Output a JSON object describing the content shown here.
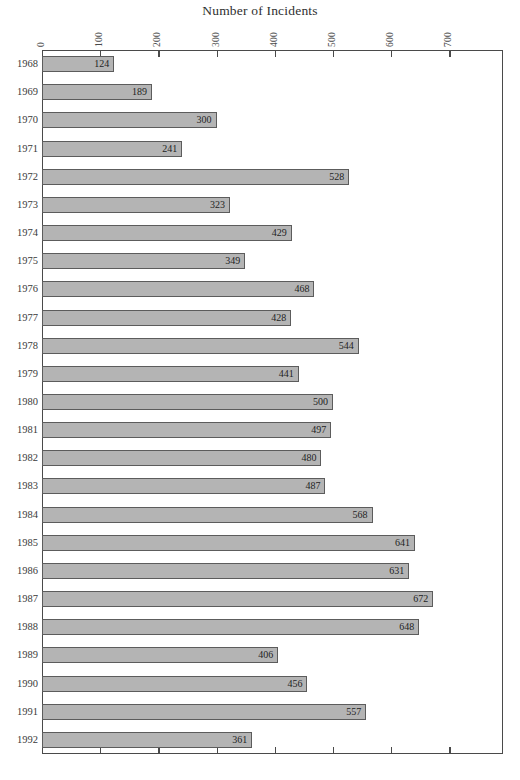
{
  "chart_data": {
    "type": "bar",
    "orientation": "horizontal",
    "title": "Number of Incidents",
    "xlabel": "",
    "ylabel": "",
    "xlim": [
      0,
      792
    ],
    "xticks": [
      0,
      100,
      200,
      300,
      400,
      500,
      600,
      700
    ],
    "xtick_labels": [
      "0",
      "100",
      "200",
      "300",
      "400",
      "500",
      "600",
      "700"
    ],
    "grid": false,
    "legend": null,
    "bar_labels_shown": true,
    "categories": [
      "1968",
      "1969",
      "1970",
      "1971",
      "1972",
      "1973",
      "1974",
      "1975",
      "1976",
      "1977",
      "1978",
      "1979",
      "1980",
      "1981",
      "1982",
      "1983",
      "1984",
      "1985",
      "1986",
      "1987",
      "1988",
      "1989",
      "1990",
      "1991",
      "1992"
    ],
    "values": [
      124,
      189,
      300,
      241,
      528,
      323,
      429,
      349,
      468,
      428,
      544,
      441,
      500,
      497,
      480,
      487,
      568,
      641,
      631,
      672,
      648,
      406,
      456,
      557,
      361
    ]
  },
  "style": {
    "bar_fill": "#b4b4b4",
    "bar_border": "#5c5c5c",
    "frame_color": "#4a4a4a",
    "plot_background": "#ffffff",
    "text_color": "#2b2b2b"
  }
}
